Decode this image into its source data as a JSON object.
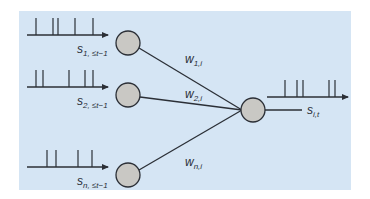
{
  "diagram": {
    "type": "spiking-neuron-network",
    "background_color": "#d5e5f4",
    "neuron_fill": "#c9c8c4",
    "stroke_color": "#2b2f36",
    "inputs": [
      {
        "id": "s1",
        "label_main": "s",
        "label_sub": "1, ≤t−1",
        "weight_main": "w",
        "weight_sub": "1,i",
        "spikes": [
          36,
          53,
          58,
          75,
          93
        ]
      },
      {
        "id": "s2",
        "label_main": "s",
        "label_sub": "2, ≤t−1",
        "weight_main": "w",
        "weight_sub": "2,i",
        "spikes": [
          36,
          43,
          69,
          85,
          93
        ]
      },
      {
        "id": "sn",
        "label_main": "s",
        "label_sub": "n, ≤t−1",
        "weight_main": "w",
        "weight_sub": "n,i",
        "spikes": [
          47,
          56,
          78,
          92
        ]
      }
    ],
    "output": {
      "id": "si",
      "label_main": "s",
      "label_sub": "i,t",
      "spikes": [
        285,
        297,
        303,
        329,
        335
      ]
    }
  }
}
